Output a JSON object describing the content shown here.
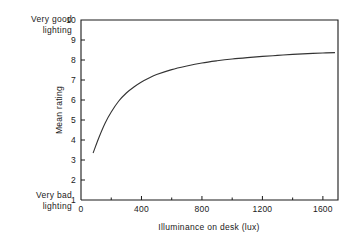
{
  "annotations": {
    "top_left": "Very good\nlighting",
    "bottom_left": "Very bad\nlighting"
  },
  "chart_data": {
    "type": "line",
    "title": "",
    "xlabel": "Illuminance on desk (lux)",
    "ylabel": "Mean rating",
    "xlim": [
      0,
      1700
    ],
    "ylim": [
      1,
      10
    ],
    "grid": false,
    "legend": null,
    "x_ticks": [
      0,
      400,
      800,
      1200,
      1600
    ],
    "x_tick_labels": [
      "0",
      "400",
      "800",
      "1200",
      "1600"
    ],
    "x_minor_ticks": [
      200,
      600,
      1000,
      1400
    ],
    "y_ticks": [
      1,
      2,
      3,
      4,
      5,
      6,
      7,
      8,
      9,
      10
    ],
    "y_tick_labels": [
      "1",
      "2",
      "3",
      "4",
      "5",
      "6",
      "7",
      "8",
      "9",
      "10"
    ],
    "line_color": "#333333",
    "x": [
      80,
      120,
      160,
      200,
      250,
      300,
      350,
      400,
      450,
      500,
      600,
      700,
      800,
      900,
      1000,
      1100,
      1200,
      1300,
      1400,
      1500,
      1600,
      1680
    ],
    "y": [
      3.35,
      4.15,
      4.85,
      5.4,
      5.95,
      6.35,
      6.65,
      6.9,
      7.1,
      7.27,
      7.52,
      7.7,
      7.85,
      7.96,
      8.05,
      8.12,
      8.18,
      8.23,
      8.28,
      8.32,
      8.35,
      8.37
    ],
    "series": [
      {
        "name": "Mean rating vs illuminance",
        "x": [
          80,
          120,
          160,
          200,
          250,
          300,
          350,
          400,
          450,
          500,
          600,
          700,
          800,
          900,
          1000,
          1100,
          1200,
          1300,
          1400,
          1500,
          1600,
          1680
        ],
        "values": [
          3.35,
          4.15,
          4.85,
          5.4,
          5.95,
          6.35,
          6.65,
          6.9,
          7.1,
          7.27,
          7.52,
          7.7,
          7.85,
          7.96,
          8.05,
          8.12,
          8.18,
          8.23,
          8.28,
          8.32,
          8.35,
          8.37
        ]
      }
    ]
  }
}
